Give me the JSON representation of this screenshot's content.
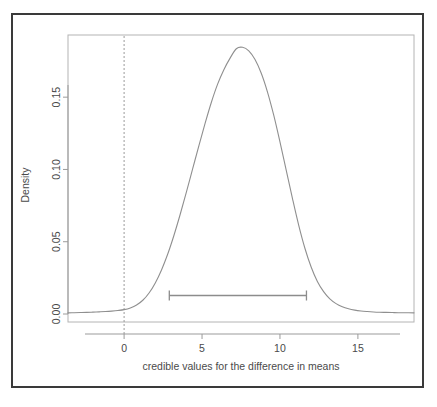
{
  "chart_data": {
    "type": "line",
    "title": "",
    "subtitle": "",
    "xlabel": "credible values for the difference in means",
    "ylabel": "Density",
    "xlim": [
      -3.6,
      18.6
    ],
    "ylim": [
      0.0,
      0.193
    ],
    "grid": false,
    "legend": null,
    "xticks": [
      0,
      5,
      10,
      15
    ],
    "xtick_labels": [
      "0",
      "5",
      "10",
      "15"
    ],
    "yticks": [
      0.0,
      0.05,
      0.1,
      0.15
    ],
    "ytick_labels": [
      "0.00",
      "0.05",
      "0.10",
      "0.15"
    ],
    "series": [
      {
        "name": "posterior density",
        "x": [
          -3.6,
          -3.2,
          -2.8,
          -2.4,
          -2.0,
          -1.6,
          -1.2,
          -0.8,
          -0.4,
          0.0,
          0.4,
          0.8,
          1.2,
          1.6,
          2.0,
          2.4,
          2.8,
          3.2,
          3.6,
          4.0,
          4.4,
          4.8,
          5.2,
          5.6,
          6.0,
          6.4,
          6.8,
          7.2,
          7.6,
          8.0,
          8.4,
          8.8,
          9.2,
          9.6,
          10.0,
          10.4,
          10.8,
          11.2,
          11.6,
          12.0,
          12.4,
          12.8,
          13.2,
          13.6,
          14.0,
          14.4,
          14.8,
          15.2,
          15.6,
          16.0,
          16.4,
          16.8,
          17.2,
          17.6,
          18.0,
          18.6
        ],
        "y": [
          0.0008,
          0.0009,
          0.001,
          0.0011,
          0.0013,
          0.0015,
          0.0017,
          0.002,
          0.0024,
          0.003,
          0.0042,
          0.0062,
          0.0095,
          0.0145,
          0.0215,
          0.0305,
          0.0415,
          0.0545,
          0.069,
          0.0845,
          0.1005,
          0.1165,
          0.132,
          0.1465,
          0.159,
          0.169,
          0.177,
          0.1835,
          0.1845,
          0.182,
          0.176,
          0.1665,
          0.1535,
          0.1375,
          0.119,
          0.0995,
          0.08,
          0.0615,
          0.0455,
          0.0325,
          0.0225,
          0.0155,
          0.0105,
          0.0072,
          0.005,
          0.0036,
          0.0027,
          0.0021,
          0.0017,
          0.0014,
          0.0012,
          0.0011,
          0.001,
          0.0009,
          0.0009,
          0.0008
        ]
      }
    ],
    "annotations": [
      {
        "name": "rope-line",
        "kind": "vertical-dashed-line",
        "x": 0,
        "style": "dashed",
        "color": "#9a9a9a"
      },
      {
        "name": "hdi-interval",
        "kind": "horizontal-interval-bar",
        "x_start": 2.9,
        "x_end": 11.7,
        "y": 0.0128,
        "color": "#8c8c8c",
        "label": ""
      }
    ],
    "colors": {
      "curve": "#8f8f8f",
      "axis": "#9b9b9b",
      "text": "#4a4a4a",
      "outer_border": "#3a3a3a",
      "background": "#ffffff"
    }
  }
}
